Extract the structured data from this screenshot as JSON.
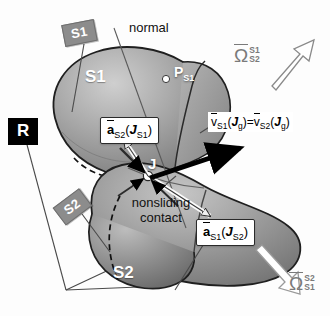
{
  "figure": {
    "type": "technical-diagram"
  },
  "frame": {
    "label": "R"
  },
  "tags": {
    "s1_tag": "S1",
    "s2_tag": "S2"
  },
  "bodies": {
    "upper_label": "S1",
    "lower_label": "S2"
  },
  "annotations": {
    "normal": "normal",
    "nonsliding_line1": "nonsliding",
    "nonsliding_line2": "contact",
    "contact_point": "J",
    "point_ps1": "P",
    "point_ps1_sub": "S1"
  },
  "vectors": {
    "a_s2_js1": {
      "symbol": "a",
      "sub": "S2",
      "arg": "J",
      "arg_sub": "S1"
    },
    "a_s1_js2": {
      "symbol": "a",
      "sub": "S1",
      "arg": "J",
      "arg_sub": "S2"
    },
    "velocity_equation": {
      "left_symbol": "v",
      "left_sub": "S1",
      "left_arg": "J",
      "left_arg_sub": "g",
      "equals": "=",
      "right_symbol": "v",
      "right_sub": "S2",
      "right_arg": "J",
      "right_arg_sub": "g"
    },
    "omega_s1_s2": {
      "symbol": "Ω",
      "sup": "S1",
      "sub": "S2"
    },
    "omega_s2_s1": {
      "symbol": "Ω",
      "sup": "S2",
      "sub": "S1"
    }
  },
  "colors": {
    "body_fill_dark": "#8a8a8a",
    "body_fill_light": "#b9b9b9",
    "tag_gray": "#8c8c8c",
    "frame_black": "#000000",
    "omega_gray": "#7a7a7a",
    "outline": "#1a1a1a"
  }
}
